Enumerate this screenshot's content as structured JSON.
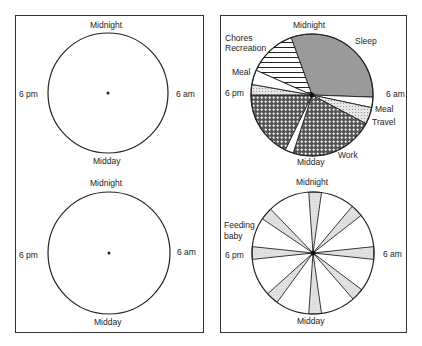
{
  "figure": {
    "left_panel": {
      "clock_top": {
        "top": "Midnight",
        "right": "6 am",
        "bottom": "Midday",
        "left": "6 pm"
      },
      "clock_bottom": {
        "top": "Midnight",
        "right": "6 am",
        "bottom": "Midday",
        "left": "6 pm"
      }
    },
    "right_panel": {
      "clock_top": {
        "top": "Midnight",
        "right": "6 am",
        "bottom": "Midday",
        "left": "6 pm",
        "segment_labels": {
          "sleep": "Sleep",
          "meal_morning": "Meal",
          "travel": "Travel",
          "work": "Work",
          "meal_evening": "Meal",
          "chores": "Chores",
          "recreation": "Recreation"
        }
      },
      "clock_bottom": {
        "top": "Midnight",
        "right": "6 am",
        "bottom": "Midday",
        "left": "6 pm",
        "annotation_line1": "Feeding",
        "annotation_line2": "baby"
      }
    }
  },
  "chart_data": [
    {
      "type": "pie",
      "title": "Blank 24-hour clock (template)",
      "labels": [
        "Midnight",
        "6 am",
        "Midday",
        "6 pm"
      ],
      "values": []
    },
    {
      "type": "pie",
      "title": "Blank 24-hour clock (template)",
      "labels": [
        "Midnight",
        "6 am",
        "Midday",
        "6 pm"
      ],
      "values": []
    },
    {
      "type": "pie",
      "title": "24-hour clock: typical working day",
      "start": "Midnight at top, clockwise",
      "segments": [
        {
          "label": "Sleep",
          "start_deg": 340,
          "end_deg": 92,
          "pattern": "grey fill"
        },
        {
          "label": "Meal",
          "start_deg": 92,
          "end_deg": 102,
          "pattern": "white"
        },
        {
          "label": "Travel",
          "start_deg": 102,
          "end_deg": 118,
          "pattern": "dotted"
        },
        {
          "label": "Work",
          "start_deg": 118,
          "end_deg": 198,
          "pattern": "crosshatch"
        },
        {
          "label": "Meal (midday)",
          "start_deg": 198,
          "end_deg": 206,
          "pattern": "white"
        },
        {
          "label": "Work",
          "start_deg": 206,
          "end_deg": 270,
          "pattern": "crosshatch"
        },
        {
          "label": "Travel",
          "start_deg": 270,
          "end_deg": 280,
          "pattern": "dotted"
        },
        {
          "label": "Meal",
          "start_deg": 280,
          "end_deg": 294,
          "pattern": "white"
        },
        {
          "label": "Chores / Recreation",
          "start_deg": 294,
          "end_deg": 340,
          "pattern": "horizontal stripes"
        }
      ]
    },
    {
      "type": "pie",
      "title": "24-hour clock: feeding baby",
      "start": "Midnight at top, clockwise",
      "segments": [
        {
          "label": "Feeding baby",
          "start_deg": 356,
          "end_deg": 8
        },
        {
          "label": "Feeding baby",
          "start_deg": 40,
          "end_deg": 52
        },
        {
          "label": "Feeding baby",
          "start_deg": 84,
          "end_deg": 96
        },
        {
          "label": "Feeding baby",
          "start_deg": 127,
          "end_deg": 139
        },
        {
          "label": "Feeding baby",
          "start_deg": 172,
          "end_deg": 184
        },
        {
          "label": "Feeding baby",
          "start_deg": 216,
          "end_deg": 228
        },
        {
          "label": "Feeding baby",
          "start_deg": 264,
          "end_deg": 276
        },
        {
          "label": "Feeding baby",
          "start_deg": 304,
          "end_deg": 316
        }
      ]
    }
  ]
}
